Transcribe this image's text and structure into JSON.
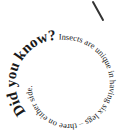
{
  "stroke": {
    "color": "#333333"
  },
  "spiral": {
    "headline": "Did you know?",
    "body_outer": " Insects are unique in having",
    "body_inner": " six legs – three on either side."
  },
  "colors": {
    "text": "#1a1a1a",
    "background": "#ffffff"
  }
}
